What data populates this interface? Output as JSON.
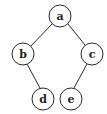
{
  "diagram": {
    "type": "binary-tree",
    "nodes": [
      {
        "id": "a",
        "label": "a",
        "x": 60,
        "y": 16
      },
      {
        "id": "b",
        "label": "b",
        "x": 23,
        "y": 54
      },
      {
        "id": "c",
        "label": "c",
        "x": 92,
        "y": 54
      },
      {
        "id": "d",
        "label": "d",
        "x": 43,
        "y": 99
      },
      {
        "id": "e",
        "label": "e",
        "x": 71,
        "y": 99
      }
    ],
    "edges": [
      {
        "from": "a",
        "to": "b"
      },
      {
        "from": "a",
        "to": "c"
      },
      {
        "from": "b",
        "to": "d"
      },
      {
        "from": "c",
        "to": "e"
      }
    ],
    "node_radius": 11,
    "colors": {
      "stroke": "#2a2a2a",
      "fill": "#ffffff",
      "text": "#222222"
    }
  }
}
